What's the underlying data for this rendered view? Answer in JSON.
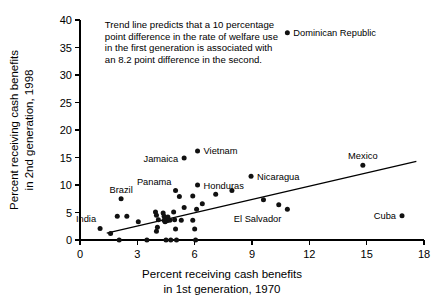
{
  "chart_data": {
    "type": "scatter",
    "title": "",
    "xlabel": "Percent receiving cash benefits in 1st generation, 1970",
    "ylabel": "Percent receiving cash benefits in 2nd generation, 1998",
    "xlabel_line1": "Percent receiving cash benefits",
    "xlabel_line2": "in 1st generation, 1970",
    "ylabel_line1": "Percent receiving cash benefits",
    "ylabel_line2": "in 2nd generation, 1998",
    "xlim": [
      0,
      18
    ],
    "ylim": [
      0,
      40
    ],
    "xticks": [
      0,
      3,
      6,
      9,
      12,
      15,
      18
    ],
    "yticks": [
      0,
      5,
      10,
      15,
      20,
      25,
      30,
      35,
      40
    ],
    "xtick_labels": [
      "0",
      "3",
      "6",
      "9",
      "12",
      "15",
      "18"
    ],
    "ytick_labels": [
      "0",
      "5",
      "10",
      "15",
      "20",
      "25",
      "30",
      "35",
      "40"
    ],
    "grid": false,
    "legend": "none",
    "annotation": {
      "lines": [
        "Trend line predicts that a 10 percentage",
        "point difference in the rate of welfare use",
        "in the first generation is associated with",
        "an 8.2 point difference in the second."
      ],
      "x": 1.3,
      "y": 38.5
    },
    "trend_line": {
      "x": [
        1.4,
        17.6
      ],
      "y": [
        1.25,
        14.3
      ],
      "slope": 0.82,
      "intercept": 0.1
    },
    "labeled_points": [
      {
        "name": "Dominican Republic",
        "x": 10.85,
        "y": 37.7,
        "label_side": "right"
      },
      {
        "name": "Vietnam",
        "x": 6.15,
        "y": 16.2,
        "label_side": "right"
      },
      {
        "name": "Jamaica",
        "x": 5.45,
        "y": 14.9,
        "label_side": "left"
      },
      {
        "name": "Mexico",
        "x": 14.8,
        "y": 13.6,
        "label_side": "above"
      },
      {
        "name": "Nicaragua",
        "x": 8.95,
        "y": 11.6,
        "label_side": "right"
      },
      {
        "name": "Honduras",
        "x": 6.15,
        "y": 10.0,
        "label_side": "right"
      },
      {
        "name": "Panama",
        "x": 5.0,
        "y": 9.0,
        "label_side": "above-left"
      },
      {
        "name": "Brazil",
        "x": 2.15,
        "y": 7.5,
        "label_side": "above"
      },
      {
        "name": "El Salvador",
        "x": 10.85,
        "y": 5.6,
        "label_side": "below-left"
      },
      {
        "name": "Cuba",
        "x": 16.85,
        "y": 4.4,
        "label_side": "left"
      },
      {
        "name": "India",
        "x": 1.05,
        "y": 2.1,
        "label_side": "above-left"
      }
    ],
    "unlabeled_points": [
      {
        "x": 1.6,
        "y": 1.2
      },
      {
        "x": 1.95,
        "y": 4.3
      },
      {
        "x": 2.45,
        "y": 4.3
      },
      {
        "x": 2.05,
        "y": 0.0
      },
      {
        "x": 3.05,
        "y": 3.3
      },
      {
        "x": 3.5,
        "y": 0.0
      },
      {
        "x": 3.95,
        "y": 5.1
      },
      {
        "x": 4.0,
        "y": 4.5
      },
      {
        "x": 4.1,
        "y": 3.7
      },
      {
        "x": 4.05,
        "y": 2.3
      },
      {
        "x": 4.0,
        "y": 1.6
      },
      {
        "x": 4.35,
        "y": 4.9
      },
      {
        "x": 4.4,
        "y": 4.3
      },
      {
        "x": 4.4,
        "y": 3.6
      },
      {
        "x": 4.45,
        "y": 3.3
      },
      {
        "x": 4.5,
        "y": 3.9
      },
      {
        "x": 4.55,
        "y": 3.5
      },
      {
        "x": 4.6,
        "y": 4.2
      },
      {
        "x": 4.7,
        "y": 3.6
      },
      {
        "x": 4.5,
        "y": 0.0
      },
      {
        "x": 4.75,
        "y": 0.0
      },
      {
        "x": 4.9,
        "y": 5.1
      },
      {
        "x": 4.95,
        "y": 3.7
      },
      {
        "x": 5.0,
        "y": 2.0
      },
      {
        "x": 5.05,
        "y": 0.0
      },
      {
        "x": 5.2,
        "y": 7.9
      },
      {
        "x": 5.3,
        "y": 3.6
      },
      {
        "x": 5.45,
        "y": 5.9
      },
      {
        "x": 5.9,
        "y": 8.0
      },
      {
        "x": 5.9,
        "y": 3.6
      },
      {
        "x": 6.0,
        "y": 2.0
      },
      {
        "x": 6.05,
        "y": 0.0
      },
      {
        "x": 6.1,
        "y": 5.6
      },
      {
        "x": 6.4,
        "y": 6.6
      },
      {
        "x": 7.1,
        "y": 8.3
      },
      {
        "x": 7.95,
        "y": 9.0
      },
      {
        "x": 9.6,
        "y": 7.3
      },
      {
        "x": 10.4,
        "y": 6.4
      }
    ]
  }
}
